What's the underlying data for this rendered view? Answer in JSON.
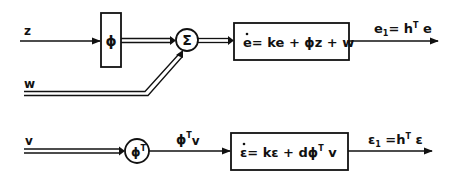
{
  "diagram": {
    "top_row": {
      "inputs": {
        "z": "z",
        "w": "w"
      },
      "phi_block": "ϕ",
      "sum_node": "Σ",
      "system_block": {
        "dot_var": "e",
        "equation_rest": "= ke + ϕz + w"
      },
      "output": {
        "lhs": "e",
        "lhs_sub": "1",
        "eq": "= h",
        "sup": "T",
        "rhs": " e"
      }
    },
    "bottom_row": {
      "input": "v",
      "phiT_node": {
        "base": "ϕ",
        "sup": "T"
      },
      "intermediate": {
        "base": "ϕ",
        "sup": "T",
        "tail": "v"
      },
      "system_block": {
        "dot_var": "ε",
        "equation_a": "= kε + dϕ",
        "sup": "T",
        "equation_b": " v"
      },
      "output": {
        "lhs": "ε",
        "lhs_sub": "1",
        "eq": " =h",
        "sup": "T",
        "rhs": " ε"
      }
    }
  },
  "colors": {
    "line": "#111111",
    "background": "#ffffff"
  }
}
